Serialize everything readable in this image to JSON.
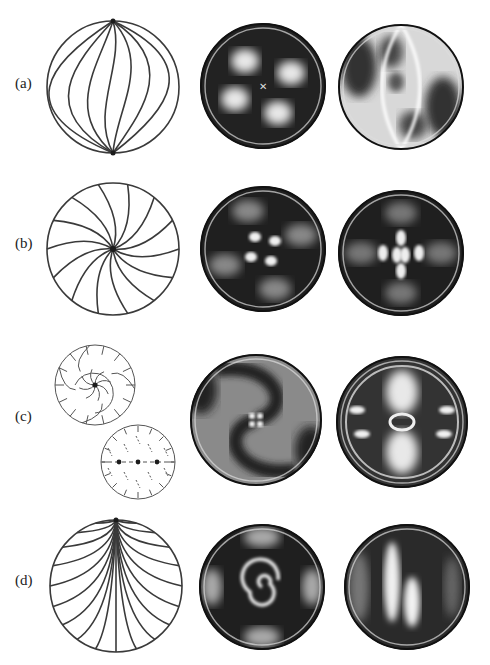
{
  "figure": {
    "rows": [
      {
        "id": "a",
        "label": "(a)",
        "schematic": "bipolar-twisted-meridians",
        "panels": [
          "photo-four-brush-cross",
          "photo-lens-shaped-texture"
        ]
      },
      {
        "id": "b",
        "label": "(b)",
        "schematic": "radial-spiral-hedgehog",
        "panels": [
          "photo-central-pinwheel",
          "photo-split-core"
        ]
      },
      {
        "id": "c",
        "label": "(c)",
        "schematic": "twisted-ring-and-three-defects",
        "panels": [
          "photo-double-spiral",
          "photo-three-defect-pattern"
        ]
      },
      {
        "id": "d",
        "label": "(d)",
        "schematic": "boojum-surface-defect",
        "panels": [
          "photo-concentric-spiral-core",
          "photo-off-center-bright-band"
        ]
      }
    ],
    "colors": {
      "ink": "#3a3a3a",
      "dark": "#1c1c1c",
      "background": "#ffffff"
    }
  }
}
